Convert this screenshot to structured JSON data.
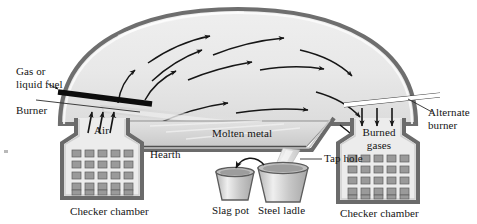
{
  "figure": {
    "background_color": "#ffffff"
  },
  "labels": {
    "gas_or_liquid_fuel_line1": "Gas or",
    "gas_or_liquid_fuel_line2": "liquid fuel",
    "burner": "Burner",
    "air": "Air",
    "hearth": "Hearth",
    "molten_metal": "Molten metal",
    "tap_hole": "Tap hole",
    "slag_pot": "Slag pot",
    "steel_ladle": "Steel ladle",
    "burned_line1": "Burned",
    "burned_line2": "gases",
    "alternate_burner_line1": "Alternate",
    "alternate_burner_line2": "burner",
    "checker_chamber_left": "Checker chamber",
    "checker_chamber_right": "Checker chamber"
  },
  "colors": {
    "outline_dark": "#4a4a4a",
    "dome_shell": "#6e6e6e",
    "dome_interior_fill": "#e9e9e9",
    "refractory_wall": "#8c8c8c",
    "checker_brick": "#9a9a9a",
    "chamber_fill": "#ececec",
    "molten_metal_fill": "#d8d8d8",
    "hearth_lining": "#c4c4c4",
    "burner_bar": "#101010",
    "alternate_burner_bar": "#ffffff",
    "vessel_fill": "#c9c9c9",
    "vessel_highlight": "#ededed",
    "pour_stream": "#dcdcdc",
    "arrow_stroke": "#161616",
    "text": "#141414",
    "flame_jet": "#dededd"
  },
  "checker_chamber_left_grid": {
    "rows": 5,
    "cols": 5
  },
  "checker_chamber_right_grid": {
    "rows": 5,
    "cols": 5
  },
  "flow_arrows": {
    "description": "curved gas-flow arrows inside furnace dome, left to right",
    "count": 12
  },
  "air_arrows": {
    "direction": "up",
    "count": 3
  },
  "burned_gas_arrows": {
    "direction": "down",
    "count": 3
  }
}
